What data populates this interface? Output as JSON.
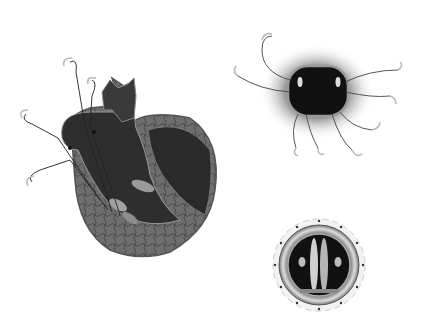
{
  "image": {
    "description": "Grayscale medical illustration of a cut-away heart with sutures, a sutured ring valve, and a prosthetic bileaflet valve",
    "background": "#ffffff",
    "colors": {
      "dark": "#1a1a1a",
      "mid": "#4a4a4a",
      "muscle": "#6b6b6b",
      "light": "#bdbdbd",
      "halo": "#8a8a8a"
    }
  },
  "figures": [
    {
      "id": "heart",
      "label": ""
    },
    {
      "id": "ring-valve",
      "label": ""
    },
    {
      "id": "mechanical-valve",
      "label": ""
    }
  ]
}
